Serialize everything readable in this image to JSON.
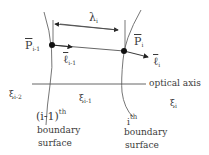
{
  "diagram": {
    "type": "ray propagation between boundary surfaces",
    "points": {
      "p_prev": {
        "symbol": "P",
        "subscript": "i-1",
        "overbar": true
      },
      "p_curr": {
        "symbol": "P",
        "subscript": "i",
        "overbar": true
      }
    },
    "vectors": {
      "l_prev": {
        "symbol": "ℓ",
        "subscript": "i-1",
        "overbar": true
      },
      "l_curr": {
        "symbol": "ℓ",
        "subscript": "i",
        "overbar": true
      }
    },
    "distance": {
      "symbol": "λ",
      "subscript": "i"
    },
    "axis_label": "optical axis",
    "media": [
      {
        "symbol": "ξ",
        "subscript": "i-2"
      },
      {
        "symbol": "ξ",
        "subscript": "i-1"
      },
      {
        "symbol": "ξ",
        "subscript": "i"
      }
    ],
    "surfaces": [
      {
        "ordinal": "(i-1)",
        "suffix": "th",
        "line1": "boundary",
        "line2": "surface"
      },
      {
        "ordinal": "i",
        "suffix": "th",
        "line1": "boundary",
        "line2": "surface"
      }
    ],
    "colors": {
      "stroke": "#555555",
      "text": "#3a3a3a",
      "point": "#111111"
    }
  }
}
